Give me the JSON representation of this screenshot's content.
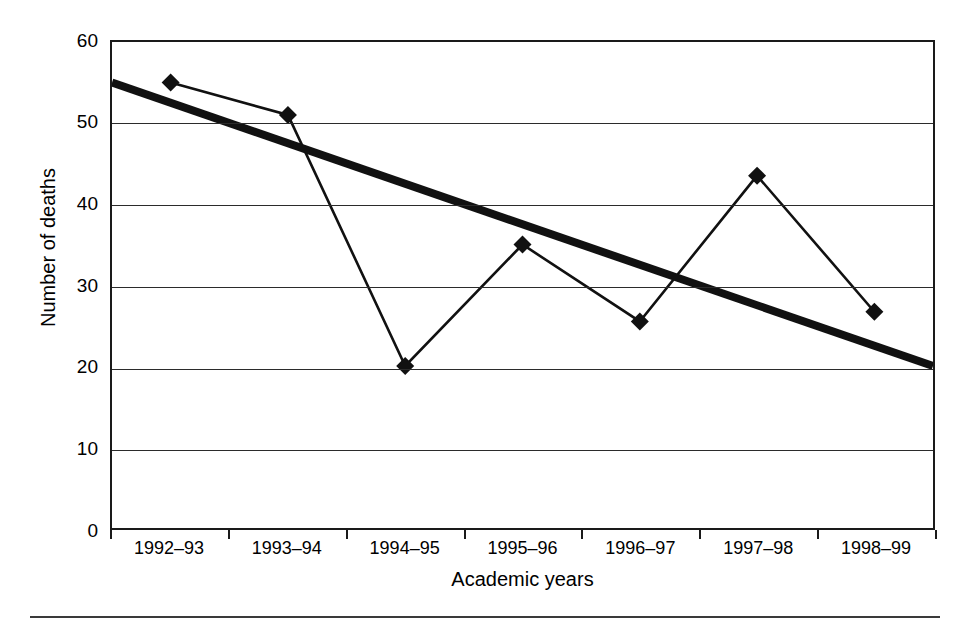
{
  "chart_data": {
    "type": "line",
    "title": "",
    "xlabel": "Academic years",
    "ylabel": "Number of deaths",
    "categories": [
      "1992–93",
      "1993–94",
      "1994–95",
      "1995–96",
      "1996–97",
      "1997–98",
      "1998–99"
    ],
    "ytick_labels": [
      "0",
      "10",
      "20",
      "30",
      "40",
      "50",
      "60"
    ],
    "ytick_values": [
      0,
      10,
      20,
      30,
      40,
      50,
      60
    ],
    "ylim": [
      0,
      60
    ],
    "grid": "horizontal",
    "legend": "none",
    "series": [
      {
        "name": "Number of deaths",
        "marker": "filled-diamond",
        "values": [
          55,
          51,
          20,
          35,
          25.5,
          43.5,
          26.7
        ]
      },
      {
        "name": "Linear trend line",
        "marker": "none",
        "style": "thick-straight",
        "endpoints": [
          55,
          20
        ],
        "x_span": "full-axis"
      }
    ],
    "colors": {
      "series_line": "#111111",
      "marker": "#111111",
      "trend_line": "#111111",
      "gridline": "#2b2b2b",
      "frame": "#1a1a1a",
      "background": "#ffffff"
    }
  },
  "axes": {
    "y_title": "Number of deaths",
    "x_title": "Academic years"
  }
}
